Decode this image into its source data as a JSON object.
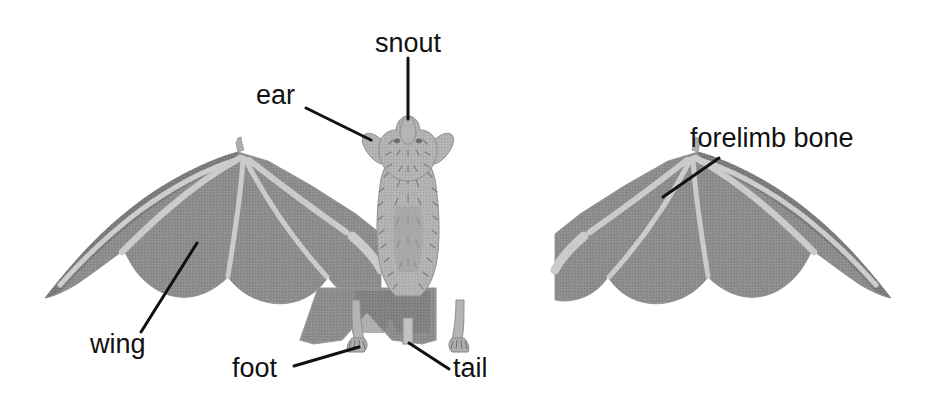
{
  "figure": {
    "type": "labeled anatomy diagram",
    "background_color": "#ffffff",
    "line_color": "#111111",
    "membrane_color": "#8d8d8d",
    "membrane_shade_color": "#787878",
    "bone_color": "#c8c8c8",
    "body_color": "#b0b0b0",
    "body_shade_color": "#9a9a9a"
  },
  "labels": [
    {
      "id": "snout",
      "text": "snout",
      "x": 375,
      "y": 30,
      "leader": [
        [
          408,
          58
        ],
        [
          408,
          119
        ]
      ]
    },
    {
      "id": "ear",
      "text": "ear",
      "x": 256,
      "y": 82,
      "leader": [
        [
          306,
          108
        ],
        [
          371,
          140
        ]
      ]
    },
    {
      "id": "forelimb-bone",
      "text": "forelimb bone",
      "x": 690,
      "y": 125,
      "leader": [
        [
          719,
          158
        ],
        [
          663,
          197
        ]
      ]
    },
    {
      "id": "wing",
      "text": "wing",
      "x": 90,
      "y": 331,
      "leader": [
        [
          141,
          332
        ],
        [
          197,
          243
        ]
      ]
    },
    {
      "id": "foot",
      "text": "foot",
      "x": 232,
      "y": 355,
      "leader": [
        [
          294,
          366
        ],
        [
          359,
          347
        ]
      ]
    },
    {
      "id": "tail",
      "text": "tail",
      "x": 453,
      "y": 355,
      "leader": [
        [
          409,
          343
        ],
        [
          449,
          369
        ]
      ]
    }
  ]
}
